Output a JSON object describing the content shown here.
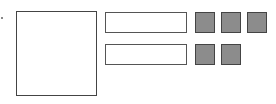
{
  "diagram": {
    "elements": [
      {
        "id": "dot",
        "type": "marker"
      },
      {
        "id": "large-box",
        "type": "rectangle",
        "fill": "#ffffff",
        "stroke": "#444444"
      },
      {
        "id": "bar-top",
        "type": "rectangle",
        "fill": "#ffffff",
        "stroke": "#555555"
      },
      {
        "id": "bar-bottom",
        "type": "rectangle",
        "fill": "#ffffff",
        "stroke": "#555555"
      }
    ],
    "rows": [
      {
        "bar": "bar-top",
        "filled_squares": 3
      },
      {
        "bar": "bar-bottom",
        "filled_squares": 2
      }
    ],
    "colors": {
      "square_fill": "#8c8c8c",
      "stroke": "#444444",
      "background": "#ffffff"
    }
  }
}
